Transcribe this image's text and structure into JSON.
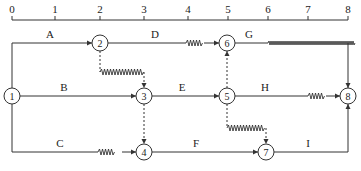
{
  "timeline": {
    "ticks": [
      "0",
      "1",
      "2",
      "3",
      "4",
      "5",
      "6",
      "7",
      "8"
    ],
    "tick_x": [
      12,
      55,
      100,
      144,
      188,
      228,
      268,
      308,
      348
    ]
  },
  "nodes": [
    {
      "id": "1",
      "label": "1",
      "x": 12,
      "y": 96
    },
    {
      "id": "2",
      "label": "2",
      "x": 100,
      "y": 43
    },
    {
      "id": "3",
      "label": "3",
      "x": 144,
      "y": 96
    },
    {
      "id": "4",
      "label": "4",
      "x": 144,
      "y": 152
    },
    {
      "id": "5",
      "label": "5",
      "x": 227,
      "y": 96
    },
    {
      "id": "6",
      "label": "6",
      "x": 227,
      "y": 43
    },
    {
      "id": "7",
      "label": "7",
      "x": 266,
      "y": 152
    },
    {
      "id": "8",
      "label": "8",
      "x": 348,
      "y": 96
    }
  ],
  "activities": [
    {
      "label": "A",
      "from": "1",
      "to": "2",
      "float": false
    },
    {
      "label": "B",
      "from": "1",
      "to": "3",
      "float": false
    },
    {
      "label": "C",
      "from": "1",
      "to": "4",
      "float": true
    },
    {
      "label": "D",
      "from": "2",
      "to": "6",
      "float": true
    },
    {
      "label": "E",
      "from": "3",
      "to": "5",
      "float": false
    },
    {
      "label": "F",
      "from": "4",
      "to": "7",
      "float": false
    },
    {
      "label": "G",
      "from": "6",
      "to": "8",
      "float": true
    },
    {
      "label": "H",
      "from": "5",
      "to": "8",
      "float": true
    },
    {
      "label": "I",
      "from": "7",
      "to": "8",
      "float": false
    }
  ],
  "dummies": [
    {
      "from": "2",
      "to": "3",
      "float": true
    },
    {
      "from": "3",
      "to": "4",
      "float": false
    },
    {
      "from": "5",
      "to": "6",
      "float": false
    },
    {
      "from": "5",
      "to": "7",
      "float": true
    }
  ],
  "labels": {
    "A": "A",
    "B": "B",
    "C": "C",
    "D": "D",
    "E": "E",
    "F": "F",
    "G": "G",
    "H": "H",
    "I": "I"
  }
}
